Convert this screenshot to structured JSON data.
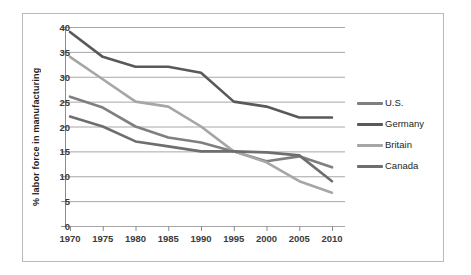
{
  "chart_data": {
    "type": "line",
    "title": "",
    "xlabel": "",
    "ylabel": "% labor force in manufacturing",
    "x": [
      1970,
      1975,
      1980,
      1985,
      1990,
      1995,
      2000,
      2005,
      2010
    ],
    "xtick_labels": [
      "1970",
      "1975",
      "1980",
      "1985",
      "1990",
      "1995",
      "2000",
      "2005",
      "2010"
    ],
    "ytick_labels": [
      "0",
      "5",
      "10",
      "15",
      "20",
      "25",
      "30",
      "35",
      "40"
    ],
    "ytick_values": [
      0,
      5,
      10,
      15,
      20,
      25,
      30,
      35,
      40
    ],
    "ylim": [
      0,
      40
    ],
    "xlim": [
      1970,
      2010
    ],
    "grid": "horizontal",
    "legend_position": "right",
    "series": [
      {
        "name": "U.S.",
        "color": "#7f7f7f",
        "values": [
          26.0,
          23.8,
          20.0,
          17.8,
          16.8,
          15.0,
          13.0,
          14.0,
          11.8
        ]
      },
      {
        "name": "Germany",
        "color": "#595959",
        "values": [
          39.0,
          34.0,
          32.0,
          32.0,
          30.8,
          25.0,
          24.0,
          21.8,
          21.8
        ]
      },
      {
        "name": "Britain",
        "color": "#a6a6a6",
        "values": [
          34.0,
          29.5,
          25.0,
          24.0,
          20.0,
          15.0,
          12.8,
          9.0,
          6.7
        ]
      },
      {
        "name": "Canada",
        "color": "#6e6e6e",
        "values": [
          22.0,
          20.0,
          17.0,
          16.0,
          15.0,
          15.0,
          14.8,
          14.2,
          9.0
        ]
      }
    ]
  },
  "legend": {
    "items": [
      {
        "label": "U.S."
      },
      {
        "label": "Germany"
      },
      {
        "label": "Britain"
      },
      {
        "label": "Canada"
      }
    ]
  },
  "colors": {
    "grid": "#9d9d9d",
    "axis": "#8c8c8c",
    "frame_border": "#b9b9b9",
    "tick_text": "#3b3b3b",
    "label_text": "#231f20",
    "background": "#ffffff"
  }
}
